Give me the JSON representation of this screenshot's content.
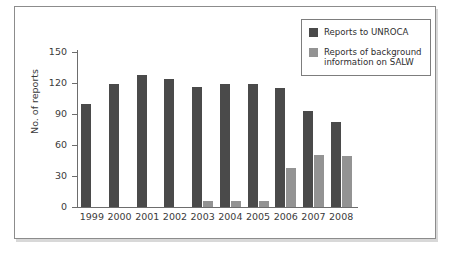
{
  "chart_data": {
    "type": "bar",
    "title": "",
    "subtitle": "",
    "xlabel": "",
    "ylabel": "No. of reports",
    "categories": [
      "1999",
      "2000",
      "2001",
      "2002",
      "2003",
      "2004",
      "2005",
      "2006",
      "2007",
      "2008"
    ],
    "series": [
      {
        "name": "Reports to UNROCA",
        "color": "#4a4a4a",
        "values": [
          100,
          119,
          128,
          124,
          116,
          119,
          119,
          115,
          93,
          82
        ]
      },
      {
        "name": "Reports of background information on SALW",
        "color": "#939393",
        "values": [
          0,
          0,
          0,
          0,
          6,
          6,
          6,
          38,
          50,
          49
        ]
      }
    ],
    "ylim": [
      0,
      150
    ],
    "yticks": [
      0,
      30,
      60,
      90,
      120,
      150
    ],
    "ytick_labels": [
      "0",
      "30",
      "60",
      "90",
      "120",
      "150"
    ],
    "grid": false,
    "legend_position": "top-right",
    "legend_entries": [
      {
        "label": "Reports to UNROCA",
        "color": "#4a4a4a"
      },
      {
        "label": "Reports of background information on SALW",
        "color": "#939393"
      }
    ]
  },
  "legend": {
    "items": [
      {
        "label": "Reports to UNROCA",
        "swatch": "legend-swatch-dark"
      },
      {
        "label": "Reports of background information on SALW",
        "swatch": "legend-swatch-gray"
      }
    ]
  },
  "colors": {
    "series_dark": "#4a4a4a",
    "series_gray": "#939393",
    "axis": "#6d6d6d",
    "frame": "#8c8c8c",
    "text": "#3b3b3b",
    "background": "#ffffff"
  }
}
